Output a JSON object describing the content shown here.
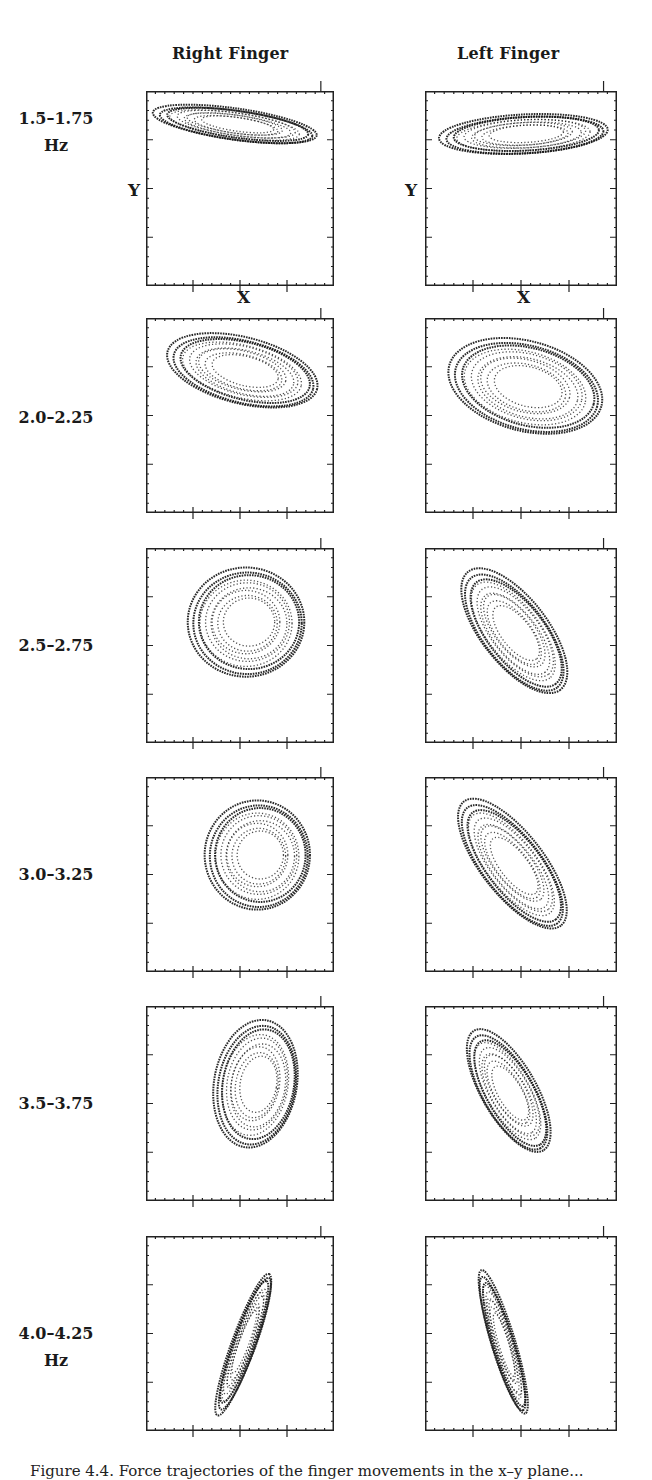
{
  "figure": {
    "columns": [
      {
        "title": "Right Finger"
      },
      {
        "title": "Left Finger"
      }
    ],
    "rows": [
      {
        "label_line1": "1.5–1.75",
        "label_line2": "Hz"
      },
      {
        "label_line1": "2.0–2.25",
        "label_line2": ""
      },
      {
        "label_line1": "2.5–2.75",
        "label_line2": ""
      },
      {
        "label_line1": "3.0–3.25",
        "label_line2": ""
      },
      {
        "label_line1": "3.5–3.75",
        "label_line2": ""
      },
      {
        "label_line1": "4.0–4.25",
        "label_line2": "Hz"
      }
    ],
    "axis_labels": {
      "x": "X",
      "y": "Y"
    },
    "caption": "Figure 4.4.  Force trajectories of the finger movements in the x–y plane..."
  },
  "chart_data": {
    "type": "scatter",
    "xlabel": "X",
    "ylabel": "Y",
    "grid": false,
    "layout": {
      "rows": 6,
      "cols": 2,
      "col_titles": [
        "Right Finger",
        "Left Finger"
      ],
      "row_labels": [
        "1.5–1.75 Hz",
        "2.0–2.25",
        "2.5–2.75",
        "3.0–3.25",
        "3.5–3.75",
        "4.0–4.25 Hz"
      ]
    },
    "axis_ticks": {
      "major_divisions": 4,
      "tick_labels": "none"
    },
    "panels": [
      {
        "row": "1.5–1.75 Hz",
        "finger": "Right",
        "shape": "flat elongated ellipse, upper region, slight downward slope left-to-right",
        "cx": 0.48,
        "cy": 0.17,
        "rx": 0.44,
        "ry": 0.08,
        "rot": 8
      },
      {
        "row": "1.5–1.75 Hz",
        "finger": "Left",
        "shape": "flat elongated ellipse, upper-middle region",
        "cx": 0.52,
        "cy": 0.22,
        "rx": 0.44,
        "ry": 0.1,
        "rot": -3
      },
      {
        "row": "2.0–2.25",
        "finger": "Right",
        "shape": "teardrop, wide, tilted, upper half",
        "cx": 0.52,
        "cy": 0.27,
        "rx": 0.41,
        "ry": 0.17,
        "rot": 14
      },
      {
        "row": "2.0–2.25",
        "finger": "Left",
        "shape": "broad irregular fan, upper half",
        "cx": 0.53,
        "cy": 0.35,
        "rx": 0.41,
        "ry": 0.23,
        "rot": 15
      },
      {
        "row": "2.5–2.75",
        "finger": "Right",
        "shape": "rounded triangle loop, centered",
        "cx": 0.54,
        "cy": 0.38,
        "rx": 0.31,
        "ry": 0.28,
        "rot": 0
      },
      {
        "row": "2.5–2.75",
        "finger": "Left",
        "shape": "elongated diagonal loop, upper-left to lower-right",
        "cx": 0.47,
        "cy": 0.43,
        "rx": 0.39,
        "ry": 0.17,
        "rot": 52
      },
      {
        "row": "3.0–3.25",
        "finger": "Right",
        "shape": "rounded triangle loop, right of center",
        "cx": 0.6,
        "cy": 0.4,
        "rx": 0.28,
        "ry": 0.28,
        "rot": 0
      },
      {
        "row": "3.0–3.25",
        "finger": "Left",
        "shape": "diagonal teardrop, upper-left to lower-right",
        "cx": 0.46,
        "cy": 0.45,
        "rx": 0.41,
        "ry": 0.16,
        "rot": 52
      },
      {
        "row": "3.5–3.75",
        "finger": "Right",
        "shape": "vertical oval, right of center",
        "cx": 0.59,
        "cy": 0.4,
        "rx": 0.22,
        "ry": 0.33,
        "rot": 10
      },
      {
        "row": "3.5–3.75",
        "finger": "Left",
        "shape": "diagonal teardrop, narrower",
        "cx": 0.44,
        "cy": 0.44,
        "rx": 0.36,
        "ry": 0.14,
        "rot": 60
      },
      {
        "row": "4.0–4.25 Hz",
        "finger": "Right",
        "shape": "thin crescent, nearly vertical",
        "cx": 0.52,
        "cy": 0.55,
        "rx": 0.4,
        "ry": 0.06,
        "rot": -70
      },
      {
        "row": "4.0–4.25 Hz",
        "finger": "Left",
        "shape": "thin diagonal band",
        "cx": 0.41,
        "cy": 0.55,
        "rx": 0.39,
        "ry": 0.06,
        "rot": 73
      }
    ]
  }
}
